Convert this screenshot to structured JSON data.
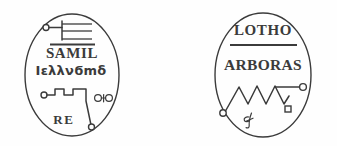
{
  "plate": {
    "title": "Two demonic seals",
    "background_color": "#fefefe",
    "ink_color": "#3b3b3b"
  },
  "seals": [
    {
      "id": "samil",
      "position": "left",
      "shape": "oval",
      "name_line": "SAMIL",
      "script_line": "Ιελλνϭmδ",
      "lower_line": "RE",
      "has_overline": true,
      "top_sigil": "circle-stem-three-bars",
      "bottom_sigil": "crenellated-line-with-nodes",
      "side_glyph": "looped-knot-glyph"
    },
    {
      "id": "arboras",
      "position": "right",
      "shape": "oval",
      "name_line": "LOTHO",
      "second_line": "ARBORAS",
      "has_divider_rule": true,
      "bottom_sigil": "zigzag-with-terminal-nodes",
      "under_glyph": "cursive-g-glyph"
    }
  ]
}
